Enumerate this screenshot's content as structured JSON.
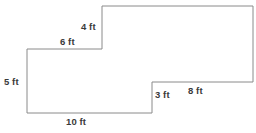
{
  "figure": {
    "type": "composite-rectilinear-polygon",
    "units": "ft",
    "stroke_color": "#8a8a8a",
    "fill_color": "#ffffff",
    "text_color": "#3a3a3a",
    "background_color": "#ffffff",
    "stroke_width": 1,
    "canvas": {
      "width": 256,
      "height": 133
    },
    "vertices": [
      {
        "name": "upper-left-step-corner",
        "x": 27,
        "y": 49
      },
      {
        "name": "step-riser-bottom",
        "x": 102,
        "y": 49
      },
      {
        "name": "step-riser-top",
        "x": 102,
        "y": 6
      },
      {
        "name": "top-right-corner",
        "x": 253,
        "y": 6
      },
      {
        "name": "right-lower-corner",
        "x": 253,
        "y": 82
      },
      {
        "name": "lower-step-corner",
        "x": 152,
        "y": 82
      },
      {
        "name": "lower-step-bottom",
        "x": 152,
        "y": 113
      },
      {
        "name": "bottom-left-corner",
        "x": 27,
        "y": 113
      }
    ],
    "path": "M 27 49 L 102 49 L 102 6 L 253 6 L 253 82 L 152 82 L 152 113 L 27 113 Z",
    "labels": [
      {
        "id": "side-4ft",
        "text": "4 ft",
        "value": 4,
        "unit": "ft",
        "edge": "step-riser-vertical",
        "orientation": "vertical",
        "left": 81,
        "top": 22
      },
      {
        "id": "side-6ft",
        "text": "6 ft",
        "value": 6,
        "unit": "ft",
        "edge": "upper-left-horizontal",
        "orientation": "horizontal",
        "left": 60,
        "top": 37
      },
      {
        "id": "side-5ft",
        "text": "5 ft",
        "value": 5,
        "unit": "ft",
        "edge": "left-vertical",
        "orientation": "vertical",
        "left": 4,
        "top": 77
      },
      {
        "id": "side-3ft",
        "text": "3 ft",
        "value": 3,
        "unit": "ft",
        "edge": "lower-step-vertical",
        "orientation": "vertical",
        "left": 155,
        "top": 90
      },
      {
        "id": "side-8ft",
        "text": "8 ft",
        "value": 8,
        "unit": "ft",
        "edge": "lower-right-horizontal",
        "orientation": "horizontal",
        "left": 188,
        "top": 86
      },
      {
        "id": "side-10ft",
        "text": "10 ft",
        "value": 10,
        "unit": "ft",
        "edge": "bottom-horizontal",
        "orientation": "horizontal",
        "left": 66,
        "top": 117
      }
    ]
  }
}
